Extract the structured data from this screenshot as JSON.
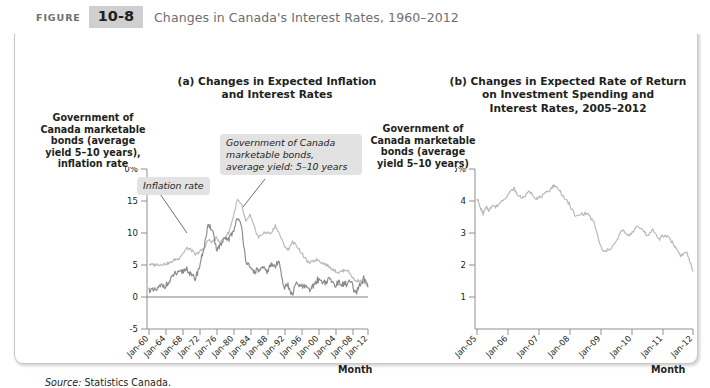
{
  "header": {
    "figure_word": "FIGURE",
    "figure_number": "10-8",
    "title": "Changes in Canada's Interest Rates, 1960–2012",
    "badge_bg": "#cfcfcf",
    "title_color": "#6d6e71"
  },
  "panel_a": {
    "title": "(a) Changes in Expected Inflation\nand Interest Rates",
    "ylabel": "Government of\nCanada marketable\nbonds (average\nyield 5–10 years),\ninflation rate",
    "xlabel": "Month",
    "callout_inflation": "Inflation rate",
    "callout_bonds": "Government of Canada\nmarketable bonds,\naverage yield: 5–10 years"
  },
  "panel_b": {
    "title": "(b) Changes in Expected Rate of Return\non Investment Spending and\nInterest Rates, 2005–2012",
    "ylabel": "Government of\nCanada marketable\nbonds (average\nyield 5–10 years)",
    "xlabel": "Month"
  },
  "source": {
    "label": "Source:",
    "text": "Statistics Canada."
  },
  "colors": {
    "bond_line": "#b9b9b9",
    "inflation_line": "#8a8a8a",
    "axis": "#8f8f8f",
    "callout_bg": "#e2e2e2",
    "text": "#231f20"
  },
  "chart_data": [
    {
      "type": "line",
      "panel": "a",
      "title": "(a) Changes in Expected Inflation and Interest Rates",
      "xlabel": "Month",
      "ylabel": "Government of Canada marketable bonds (average yield 5–10 years), inflation rate",
      "xlim": [
        1960,
        2012
      ],
      "ylim": [
        -5,
        20
      ],
      "yticks": [
        20,
        15,
        10,
        5,
        0,
        -5
      ],
      "ytick_labels": [
        "20%",
        "15",
        "10",
        "5",
        "0",
        "-5"
      ],
      "xticks": [
        1960,
        1964,
        1968,
        1972,
        1976,
        1980,
        1984,
        1988,
        1992,
        1996,
        2000,
        2004,
        2008,
        2012
      ],
      "xtick_labels": [
        "Jan-60",
        "Jan-64",
        "Jan-68",
        "Jan-72",
        "Jan-76",
        "Jan-80",
        "Jan-84",
        "Jan-88",
        "Jan-92",
        "Jan-96",
        "Jan-00",
        "Jan-04",
        "Jan-08",
        "Jan-12"
      ],
      "grid": false,
      "legend": "annotations",
      "annotations": [
        {
          "text": "Inflation rate",
          "x": 1972,
          "y": 17.5
        },
        {
          "text": "Government of Canada marketable bonds, average yield: 5–10 years",
          "x": 1986,
          "y": 19
        }
      ],
      "series": [
        {
          "name": "Government of Canada marketable bonds, average yield: 5–10 years",
          "color": "#b9b9b9",
          "x": [
            1960,
            1961,
            1962,
            1963,
            1964,
            1965,
            1966,
            1967,
            1968,
            1969,
            1970,
            1971,
            1972,
            1973,
            1974,
            1975,
            1976,
            1977,
            1978,
            1979,
            1980,
            1981,
            1982,
            1983,
            1984,
            1985,
            1986,
            1987,
            1988,
            1989,
            1990,
            1991,
            1992,
            1993,
            1994,
            1995,
            1996,
            1997,
            1998,
            1999,
            2000,
            2001,
            2002,
            2003,
            2004,
            2005,
            2006,
            2007,
            2008,
            2009,
            2010,
            2011,
            2012
          ],
          "values": [
            5.1,
            5.0,
            5.1,
            5.1,
            5.2,
            5.3,
            5.8,
            6.0,
            6.8,
            7.6,
            7.4,
            6.6,
            7.1,
            7.5,
            8.9,
            8.6,
            9.2,
            8.6,
            9.3,
            10.2,
            12.5,
            15.2,
            14.3,
            11.7,
            12.8,
            10.9,
            9.3,
            9.9,
            10.1,
            9.9,
            11.2,
            9.8,
            8.2,
            7.3,
            8.6,
            8.1,
            7.1,
            6.1,
            5.3,
            5.6,
            5.9,
            5.4,
            5.1,
            4.6,
            4.2,
            3.8,
            4.1,
            4.3,
            3.4,
            2.5,
            2.6,
            2.3,
            1.8
          ],
          "note": "Light gray line, peaks near 15-16% in 1981, declines steadily after 1990"
        },
        {
          "name": "Inflation rate",
          "color": "#8a8a8a",
          "x": [
            1960,
            1961,
            1962,
            1963,
            1964,
            1965,
            1966,
            1967,
            1968,
            1969,
            1970,
            1971,
            1972,
            1973,
            1974,
            1975,
            1976,
            1977,
            1978,
            1979,
            1980,
            1981,
            1982,
            1983,
            1984,
            1985,
            1986,
            1987,
            1988,
            1989,
            1990,
            1991,
            1992,
            1993,
            1994,
            1995,
            1996,
            1997,
            1998,
            1999,
            2000,
            2001,
            2002,
            2003,
            2004,
            2005,
            2006,
            2007,
            2008,
            2009,
            2010,
            2011,
            2012
          ],
          "values": [
            1.2,
            0.9,
            1.2,
            1.8,
            1.8,
            2.4,
            3.7,
            3.6,
            4.0,
            4.5,
            3.3,
            2.9,
            4.8,
            7.6,
            10.9,
            10.8,
            7.5,
            8.0,
            9.0,
            9.1,
            10.2,
            12.5,
            10.8,
            5.8,
            4.3,
            4.0,
            4.2,
            4.4,
            4.0,
            5.0,
            4.8,
            5.6,
            1.5,
            1.8,
            0.2,
            2.2,
            1.6,
            1.6,
            1.0,
            1.7,
            2.7,
            2.5,
            2.3,
            2.8,
            1.9,
            2.2,
            2.0,
            2.1,
            2.4,
            0.3,
            1.8,
            2.9,
            1.5
          ],
          "note": "Darker gray line, more volatile, dips below 0 in 2009"
        }
      ]
    },
    {
      "type": "line",
      "panel": "b",
      "title": "(b) Changes in Expected Rate of Return on Investment Spending and Interest Rates, 2005–2012",
      "xlabel": "Month",
      "ylabel": "Government of Canada marketable bonds (average yield 5–10 years)",
      "xlim": [
        2005,
        2012
      ],
      "ylim": [
        0,
        5
      ],
      "yticks": [
        5,
        4,
        3,
        2,
        1
      ],
      "ytick_labels": [
        "5%",
        "4",
        "3",
        "2",
        "1"
      ],
      "xticks": [
        2005,
        2006,
        2007,
        2008,
        2009,
        2010,
        2011,
        2012
      ],
      "xtick_labels": [
        "Jan-05",
        "Jan-06",
        "Jan-07",
        "Jan-08",
        "Jan-09",
        "Jan-10",
        "Jan-11",
        "Jan-12"
      ],
      "grid": false,
      "legend": "none",
      "series": [
        {
          "name": "Government of Canada marketable bonds, average yield: 5–10 years",
          "color": "#b9b9b9",
          "x": [
            2005.0,
            2005.1,
            2005.2,
            2005.3,
            2005.4,
            2005.5,
            2005.6,
            2005.8,
            2006.0,
            2006.2,
            2006.3,
            2006.5,
            2006.7,
            2006.9,
            2007.0,
            2007.2,
            2007.4,
            2007.5,
            2007.7,
            2007.9,
            2008.0,
            2008.2,
            2008.4,
            2008.6,
            2008.8,
            2009.0,
            2009.1,
            2009.3,
            2009.5,
            2009.7,
            2009.9,
            2010.0,
            2010.2,
            2010.4,
            2010.5,
            2010.7,
            2010.9,
            2011.0,
            2011.2,
            2011.4,
            2011.6,
            2011.8,
            2012.0
          ],
          "values": [
            4.1,
            3.8,
            3.6,
            3.8,
            3.7,
            3.9,
            3.8,
            4.0,
            4.2,
            4.4,
            4.2,
            4.1,
            4.3,
            4.1,
            4.1,
            4.2,
            4.4,
            4.5,
            4.3,
            4.0,
            3.9,
            3.5,
            3.6,
            3.6,
            3.3,
            2.6,
            2.4,
            2.5,
            2.7,
            3.1,
            2.9,
            3.0,
            3.2,
            3.1,
            2.9,
            3.1,
            2.8,
            2.9,
            2.9,
            2.6,
            2.3,
            2.4,
            1.8
          ],
          "note": "Single light gray line: starts ~4.1%, peaks ~4.5% mid-2007, falls to ~2.4% in 2009, ends ~1.8% in 2012"
        }
      ]
    }
  ]
}
